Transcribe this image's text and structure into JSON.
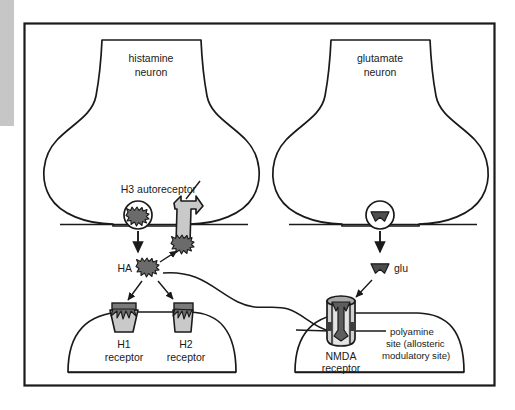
{
  "figure": {
    "type": "biological-schematic"
  },
  "frame": {
    "border_color": "#1a1a1a",
    "background": "#ffffff",
    "sidebar_color": "#c6c6c6"
  },
  "colors": {
    "outline": "#1a1a1a",
    "light_gray_fill": "#c9c9c9",
    "mid_gray_fill": "#9a9a9a",
    "dark_gray_fill": "#5a5a5a",
    "white_fill": "#ffffff"
  },
  "neurons": [
    {
      "id": "histamine-neuron",
      "label_line1": "histamine",
      "label_line2": "neuron"
    },
    {
      "id": "glutamate-neuron",
      "label_line1": "glutamate",
      "label_line2": "neuron"
    }
  ],
  "labels": {
    "h3_autoreceptor": "H3 autoreceptor",
    "ha_molecule": "HA",
    "glu_molecule": "glu",
    "h1_receptor_line1": "H1",
    "h1_receptor_line2": "receptor",
    "h2_receptor_line1": "H2",
    "h2_receptor_line2": "receptor",
    "nmda_receptor_line1": "NMDA",
    "nmda_receptor_line2": "receptor",
    "polyamine_line1": "polyamine",
    "polyamine_line2": "site (allosteric",
    "polyamine_line3": "modulatory site)"
  },
  "elements": {
    "histamine_vesicle": "vesicle-with-histamine",
    "glutamate_vesicle": "vesicle-with-glutamate",
    "release_arrow_ha": "downward-release-arrow",
    "release_arrow_glu": "downward-release-arrow",
    "binding_arrow_h1": "arrow-to-h1-receptor",
    "binding_arrow_h2": "arrow-to-h2-receptor",
    "binding_arrow_h3": "arrow-to-h3-autoreceptor",
    "binding_arrow_nmda": "arrow-to-nmda-receptor",
    "modulatory_path": "wavy-path-ha-to-nmda",
    "polyamine_leader": "leader-line-to-nmda-site",
    "h3_leader": "leader-line-to-h3-autoreceptor"
  }
}
